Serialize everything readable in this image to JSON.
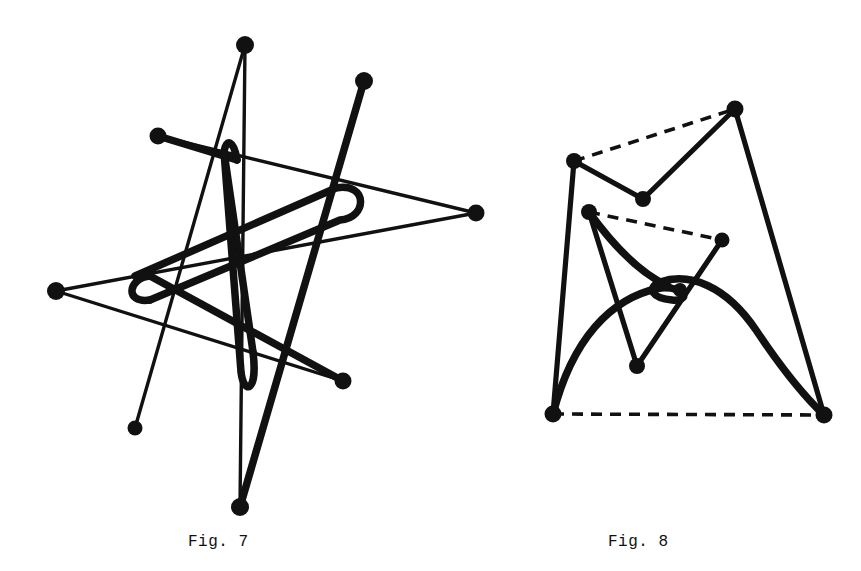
{
  "page": {
    "background_color": "#ffffff",
    "ink_color": "#111111",
    "width": 861,
    "height": 571
  },
  "captions": {
    "fig7": "Fig. 7",
    "fig8": "Fig. 8"
  },
  "figures": [
    {
      "id": "fig7",
      "caption": "Fig. 7",
      "description": "Closed self-intersecting polygonal star curve with a thick meandering spline overlaid",
      "node_count": 8,
      "nodes": [
        {
          "name": "top-apex",
          "x": 245,
          "y": 45
        },
        {
          "name": "upper-right",
          "x": 364,
          "y": 81
        },
        {
          "name": "upper-left",
          "x": 158,
          "y": 136
        },
        {
          "name": "far-right",
          "x": 476,
          "y": 213
        },
        {
          "name": "far-left",
          "x": 56,
          "y": 291
        },
        {
          "name": "mid-right",
          "x": 343,
          "y": 381
        },
        {
          "name": "lower-left",
          "x": 135,
          "y": 428
        },
        {
          "name": "bottom-apex",
          "x": 240,
          "y": 507
        }
      ]
    },
    {
      "id": "fig8",
      "caption": "Fig. 8",
      "description": "Two nested zig-zag polylines closed with dashed chords, plus a thick arc with an inner cusp",
      "node_count": 8,
      "nodes": [
        {
          "name": "outer-top-right",
          "x": 735,
          "y": 109
        },
        {
          "name": "outer-upper-left",
          "x": 574,
          "y": 161
        },
        {
          "name": "outer-valley",
          "x": 643,
          "y": 199
        },
        {
          "name": "inner-upper-left",
          "x": 589,
          "y": 212
        },
        {
          "name": "inner-right",
          "x": 722,
          "y": 240
        },
        {
          "name": "inner-cusp",
          "x": 683,
          "y": 288
        },
        {
          "name": "inner-valley",
          "x": 637,
          "y": 366
        },
        {
          "name": "bottom-left",
          "x": 553,
          "y": 414
        },
        {
          "name": "bottom-right",
          "x": 824,
          "y": 415
        }
      ],
      "dashed_chords": [
        {
          "from": "outer-upper-left",
          "to": "outer-top-right"
        },
        {
          "from": "inner-upper-left",
          "to": "inner-right"
        },
        {
          "from": "bottom-left",
          "to": "bottom-right"
        },
        {
          "from": "inner-right",
          "to": "inner-valley"
        }
      ]
    }
  ]
}
